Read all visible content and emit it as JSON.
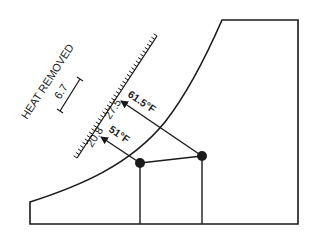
{
  "diagram": {
    "axis_label": "HEAT REMOVED",
    "scale_unit_value": "6.7",
    "scale_marks": [
      {
        "label": "20.8"
      },
      {
        "label": "27.5"
      }
    ],
    "arrows": [
      {
        "label": "51°F"
      },
      {
        "label": "61.5°F"
      }
    ],
    "colors": {
      "line": "#1a1a1a",
      "background": "#ffffff"
    }
  }
}
